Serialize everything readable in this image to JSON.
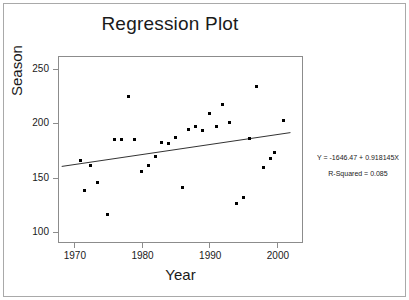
{
  "chart_data": {
    "type": "scatter",
    "title": "Regression Plot",
    "xlabel": "Year",
    "ylabel": "Season",
    "xlim": [
      1967.8,
      2004.0
    ],
    "ylim": [
      89.2,
      260.6
    ],
    "xticks": [
      "1970",
      "1980",
      "1990",
      "2000"
    ],
    "xtick_values": [
      1970,
      1980,
      1990,
      2000
    ],
    "yticks": [
      "100",
      "150",
      "200",
      "250"
    ],
    "ytick_values": [
      100,
      150,
      200,
      250
    ],
    "grid": false,
    "legend": null,
    "x": [
      1971,
      1971,
      1972,
      1973,
      1974,
      1975,
      1976,
      1977,
      1978,
      1979,
      1980,
      1981,
      1982,
      1983,
      1984,
      1985,
      1986,
      1987,
      1988,
      1989,
      1990,
      1991,
      1992,
      1993,
      1994,
      1995,
      1996,
      1997,
      1998,
      1999,
      2000,
      2001
    ],
    "y": [
      166,
      138,
      161,
      146,
      116,
      185,
      185,
      224,
      185,
      156,
      161,
      169,
      182,
      181,
      187,
      141,
      194,
      197,
      193,
      209,
      197,
      217,
      201,
      126,
      132,
      186,
      234,
      159,
      168,
      173,
      202,
      186
    ],
    "series": [
      {
        "name": "Season vs Year",
        "points": [
          {
            "x": 1971,
            "y": 166
          },
          {
            "x": 1971.5,
            "y": 138
          },
          {
            "x": 1972.5,
            "y": 161
          },
          {
            "x": 1973.5,
            "y": 146
          },
          {
            "x": 1975,
            "y": 116
          },
          {
            "x": 1976,
            "y": 185
          },
          {
            "x": 1977,
            "y": 185
          },
          {
            "x": 1978,
            "y": 224
          },
          {
            "x": 1979,
            "y": 185
          },
          {
            "x": 1980,
            "y": 156
          },
          {
            "x": 1981,
            "y": 161
          },
          {
            "x": 1982,
            "y": 169
          },
          {
            "x": 1983,
            "y": 182
          },
          {
            "x": 1984,
            "y": 181
          },
          {
            "x": 1985,
            "y": 187
          },
          {
            "x": 1986,
            "y": 141
          },
          {
            "x": 1987,
            "y": 194
          },
          {
            "x": 1988,
            "y": 197
          },
          {
            "x": 1989,
            "y": 193
          },
          {
            "x": 1990,
            "y": 209
          },
          {
            "x": 1991,
            "y": 197
          },
          {
            "x": 1992,
            "y": 217
          },
          {
            "x": 1993,
            "y": 201
          },
          {
            "x": 1994,
            "y": 126
          },
          {
            "x": 1995,
            "y": 132
          },
          {
            "x": 1996,
            "y": 186
          },
          {
            "x": 1997,
            "y": 234
          },
          {
            "x": 1998,
            "y": 159
          },
          {
            "x": 1999,
            "y": 168
          },
          {
            "x": 1999.7,
            "y": 173
          },
          {
            "x": 2001,
            "y": 202
          }
        ]
      }
    ],
    "fit_line": {
      "intercept": -1646.47,
      "slope": 0.918145,
      "x_start": 1968.2,
      "x_end": 2002.0,
      "y_start": 160.3,
      "y_end": 191.3
    },
    "annotations": {
      "equation": "Y = -1646.47 + 0.918145X",
      "r_squared": "R-Squared = 0.085"
    }
  },
  "colors": {
    "point": "#000000",
    "line": "#333333",
    "frame": "#8c8c8c",
    "text": "#1a1a1a",
    "background": "#ffffff"
  }
}
